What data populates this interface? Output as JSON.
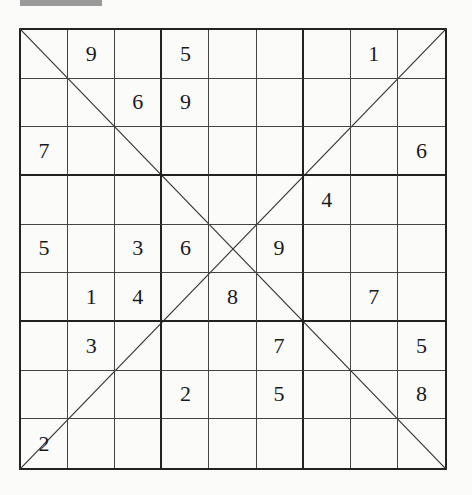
{
  "puzzle": {
    "type": "diagonal-sudoku",
    "size": 9,
    "grid": [
      [
        "",
        "9",
        "",
        "5",
        "",
        "",
        "",
        "1",
        ""
      ],
      [
        "",
        "",
        "6",
        "9",
        "",
        "",
        "",
        "",
        ""
      ],
      [
        "7",
        "",
        "",
        "",
        "",
        "",
        "",
        "",
        "6"
      ],
      [
        "",
        "",
        "",
        "",
        "",
        "",
        "4",
        "",
        ""
      ],
      [
        "5",
        "",
        "3",
        "6",
        "",
        "9",
        "",
        "",
        ""
      ],
      [
        "",
        "1",
        "4",
        "",
        "8",
        "",
        "",
        "7",
        ""
      ],
      [
        "",
        "3",
        "",
        "",
        "",
        "7",
        "",
        "",
        "5"
      ],
      [
        "",
        "",
        "",
        "2",
        "",
        "5",
        "",
        "",
        "8"
      ],
      [
        "2",
        "",
        "",
        "",
        "",
        "",
        "",
        "",
        ""
      ]
    ],
    "diagonals": [
      "top-left-to-bottom-right",
      "top-right-to-bottom-left"
    ]
  },
  "colors": {
    "background": "#fbfbfa",
    "lines": "#222222",
    "digits": "#1a1a1a"
  }
}
